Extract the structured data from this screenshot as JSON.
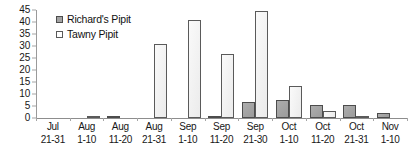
{
  "chart_data": {
    "type": "bar",
    "title": "",
    "subtitle": "",
    "xlabel": "",
    "ylabel": "",
    "ylim": [
      0,
      45
    ],
    "ytick_step": 5,
    "yticks": [
      0,
      5,
      10,
      15,
      20,
      25,
      30,
      35,
      40,
      45
    ],
    "grid": false,
    "legend_position": "top-left",
    "categories": [
      "Jul 21-31",
      "Aug 1-10",
      "Aug 11-20",
      "Aug 21-31",
      "Sep 1-10",
      "Sep 11-20",
      "Sep 21-30",
      "Oct 1-10",
      "Oct 11-20",
      "Oct 21-31",
      "Nov 1-10"
    ],
    "category_lines": [
      {
        "line1": "Jul",
        "line2": "21-31"
      },
      {
        "line1": "Aug",
        "line2": "1-10"
      },
      {
        "line1": "Aug",
        "line2": "11-20"
      },
      {
        "line1": "Aug",
        "line2": "21-31"
      },
      {
        "line1": "Sep",
        "line2": "1-10"
      },
      {
        "line1": "Sep",
        "line2": "11-20"
      },
      {
        "line1": "Sep",
        "line2": "21-30"
      },
      {
        "line1": "Oct",
        "line2": "1-10"
      },
      {
        "line1": "Oct",
        "line2": "11-20"
      },
      {
        "line1": "Oct",
        "line2": "21-31"
      },
      {
        "line1": "Nov",
        "line2": "1-10"
      }
    ],
    "series": [
      {
        "name": "Richard's Pipit",
        "color": "#a3a3a3",
        "border_color": "#4c4c4c",
        "values": [
          0,
          0,
          0.5,
          0,
          0,
          0.5,
          6.5,
          7.5,
          5.5,
          5.5,
          2
        ]
      },
      {
        "name": "Tawny Pipit",
        "color": "#f4f4f4",
        "border_color": "#5a5a5a",
        "values": [
          0,
          1,
          0,
          31,
          41,
          26.5,
          44.5,
          13.5,
          3,
          0.5,
          0
        ]
      }
    ]
  },
  "legend": {
    "items": [
      {
        "label": "Richard's Pipit",
        "swatch": "richards"
      },
      {
        "label": "Tawny Pipit",
        "swatch": "tawny"
      }
    ]
  }
}
